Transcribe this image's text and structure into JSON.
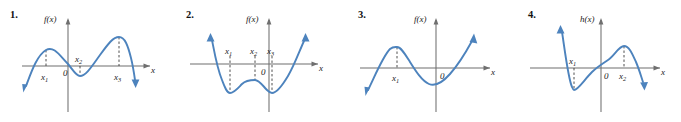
{
  "figure": {
    "kind": "math-textbook-graph-set",
    "panel_count": 4,
    "curve_color": "#4d83bd",
    "axis_color": "#6f6f6f",
    "dash_color": "#3a3a3a",
    "background": "#ffffff"
  },
  "panels": [
    {
      "number": "1.",
      "function_label": "f(x)",
      "x_axis_label": "x",
      "origin_label": "0",
      "critical_labels": [
        "x₁",
        "x₂",
        "x₃"
      ],
      "critical_label_text": [
        "x",
        "x",
        "x"
      ],
      "critical_label_subs": [
        "1",
        "2",
        "3"
      ],
      "shape": "quartic, negative leading coefficient",
      "features": "local max at x1 (left of origin, above axis), local min at x2 (right of origin, below axis), local max at x3 (right of origin, above axis); falls to -infinity on both ends"
    },
    {
      "number": "2.",
      "function_label": "f(x)",
      "x_axis_label": "x",
      "origin_label": "0",
      "critical_labels": [
        "x₁",
        "x₂",
        "x₃"
      ],
      "critical_label_text": [
        "x",
        "x",
        "x"
      ],
      "critical_label_subs": [
        "1",
        "2",
        "3"
      ],
      "shape": "quartic, positive leading coefficient (W shape)",
      "features": "local min at x1 (below axis), local max at x2 (below axis, just left of origin), local min at x3 (below axis, just right of origin); rises to +infinity on both ends"
    },
    {
      "number": "3.",
      "function_label": "f(x)",
      "x_axis_label": "x",
      "origin_label": "0",
      "critical_labels": [
        "x₁"
      ],
      "critical_label_text": [
        "x"
      ],
      "critical_label_subs": [
        "1"
      ],
      "shape": "cubic, positive leading coefficient",
      "features": "local max at x1 (left of origin, above axis), local min right of origin (below axis); falls to -infinity at left, rises to +infinity at right"
    },
    {
      "number": "4.",
      "function_label": "h(x)",
      "x_axis_label": "x",
      "origin_label": "0",
      "critical_labels": [
        "x₁",
        "x₂"
      ],
      "critical_label_text": [
        "x",
        "x"
      ],
      "critical_label_subs": [
        "1",
        "2"
      ],
      "shape": "cubic, negative leading coefficient",
      "features": "local min at x1 (left of origin, below axis), local max at x2 (right of origin, above axis); rises to +infinity at left, falls to -infinity at right"
    }
  ]
}
